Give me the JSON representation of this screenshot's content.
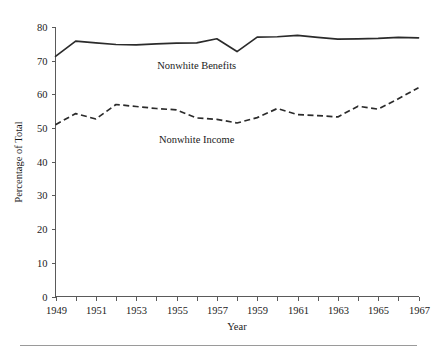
{
  "chart_data": {
    "type": "line",
    "title": "",
    "subtitle": "",
    "xlabel": "Year",
    "ylabel": "Percentage of Total",
    "xlim": [
      1949,
      1967
    ],
    "ylim": [
      0,
      80
    ],
    "grid": false,
    "legend_position": "inline-annotation",
    "x": [
      1949,
      1950,
      1951,
      1952,
      1953,
      1954,
      1955,
      1956,
      1957,
      1958,
      1959,
      1960,
      1961,
      1962,
      1963,
      1964,
      1965,
      1966,
      1967
    ],
    "y_ticks": [
      0,
      10,
      20,
      30,
      40,
      50,
      60,
      70,
      80
    ],
    "y_tick_labels": [
      "0",
      "10",
      "20",
      "30",
      "40",
      "50",
      "60",
      "70",
      "80"
    ],
    "x_ticks": [
      1949,
      1950,
      1951,
      1952,
      1953,
      1954,
      1955,
      1956,
      1957,
      1958,
      1959,
      1960,
      1961,
      1962,
      1963,
      1964,
      1965,
      1966,
      1967
    ],
    "x_tick_labels": [
      "1949",
      "",
      "1951",
      "",
      "1953",
      "",
      "1955",
      "",
      "1957",
      "",
      "1959",
      "",
      "1961",
      "",
      "1963",
      "",
      "1965",
      "",
      "1967"
    ],
    "x_major_labels": [
      "1949",
      "1951",
      "1953",
      "1955",
      "1957",
      "1959",
      "1961",
      "1963",
      "1965",
      "1967"
    ],
    "series": [
      {
        "name": "Nonwhite Benefits",
        "style": "solid",
        "color": "#2b2b2b",
        "label_x": 1956.0,
        "label_y": 67.5,
        "values": [
          71.3,
          75.8,
          75.3,
          74.8,
          74.7,
          75.0,
          75.2,
          75.3,
          76.5,
          72.7,
          77.0,
          77.1,
          77.5,
          76.9,
          76.4,
          76.5,
          76.6,
          76.9,
          76.8
        ]
      },
      {
        "name": "Nonwhite Income",
        "style": "dashed",
        "color": "#2b2b2b",
        "label_x": 1956.0,
        "label_y": 45.5,
        "values": [
          51.0,
          54.3,
          52.7,
          57.0,
          56.4,
          55.8,
          55.4,
          53.0,
          52.6,
          51.5,
          53.1,
          55.8,
          54.0,
          53.7,
          53.3,
          56.5,
          55.6,
          58.7,
          62.0
        ]
      }
    ]
  },
  "figure": {
    "axis_color": "#5a5a5a",
    "ink_color": "#2b2b2b",
    "background": "#ffffff",
    "footer_rule_color": "#9a9a9a"
  }
}
